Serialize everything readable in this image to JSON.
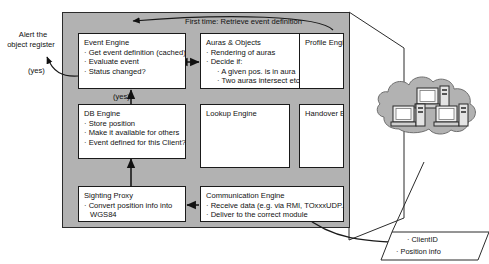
{
  "diagram": {
    "panel": {
      "fill": "#b2b2b2",
      "stroke": "#2b2b2b"
    },
    "annotations": {
      "top_flow": "First time: Retrieve event definition",
      "alert_line1": "Alert the",
      "alert_line2": "object register",
      "yes_left": "(yes)",
      "yes_center": "(yes)"
    },
    "boxes": [
      {
        "id": "event-engine",
        "title": "Event Engine",
        "items": [
          {
            "text": "· Get event definition (cached)",
            "level": 0
          },
          {
            "text": "· Evaluate event",
            "level": 0
          },
          {
            "text": "· Status changed?",
            "level": 0
          }
        ]
      },
      {
        "id": "auras-objects",
        "title": "Auras & Objects",
        "items": [
          {
            "text": "· Rendering of auras",
            "level": 0
          },
          {
            "text": "· Decide if:",
            "level": 0
          },
          {
            "text": "· A given pos. is in aura",
            "level": 1
          },
          {
            "text": "· Two auras intersect etc.",
            "level": 1
          }
        ]
      },
      {
        "id": "profile-engine",
        "title": "Profile Engine",
        "items": []
      },
      {
        "id": "db-engine",
        "title": "DB Engine",
        "items": [
          {
            "text": "· Store position",
            "level": 0
          },
          {
            "text": "· Make it available for others",
            "level": 0
          },
          {
            "text": "· Event defined for this Client?",
            "level": 0
          }
        ]
      },
      {
        "id": "lookup-engine",
        "title": "Lookup Engine",
        "items": []
      },
      {
        "id": "handover-engine",
        "title": "Handover Engine",
        "items": []
      },
      {
        "id": "sighting-proxy",
        "title": "Sighting Proxy",
        "items": [
          {
            "text": "· Convert position info into",
            "level": 0
          },
          {
            "text": "WGS84",
            "level": 2
          }
        ]
      },
      {
        "id": "communication-engine",
        "title": "Communication Engine",
        "items": [
          {
            "text": "· Receive data (e.g. via RMI, TOxxxUDP...)",
            "level": 0
          },
          {
            "text": "· Deliver to the correct module",
            "level": 0
          }
        ]
      }
    ],
    "client_payload": {
      "line1": "· ClientID",
      "line2": "· Position info"
    },
    "cloud": {
      "name": "network-cloud",
      "nodes": [
        "workstation-top",
        "workstation-left",
        "workstation-right"
      ]
    }
  }
}
